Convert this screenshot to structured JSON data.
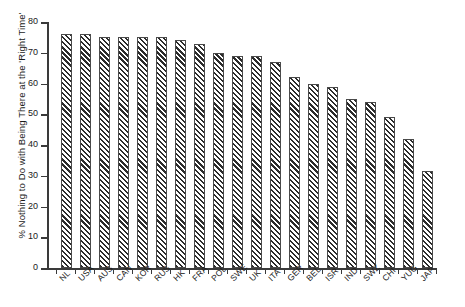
{
  "chart_data": {
    "type": "bar",
    "title": "",
    "xlabel": "",
    "ylabel": "% Nothing to Do with Being There at the 'Right Time'",
    "ylim": [
      0,
      80
    ],
    "yticks": [
      0,
      10,
      20,
      30,
      40,
      50,
      60,
      70,
      80
    ],
    "ytick_labels": [
      "0",
      "10",
      "20",
      "30",
      "40",
      "50",
      "60",
      "70",
      "80"
    ],
    "grid": false,
    "legend": null,
    "bar_fill": "diagonal-hatch",
    "categories": [
      "NL",
      "USA",
      "AUS",
      "CAN",
      "KOR",
      "RUS",
      "HK",
      "FRA",
      "POL",
      "SWE",
      "UK",
      "ITA",
      "GER",
      "BEL",
      "ISR",
      "IND",
      "SWZ",
      "CHI",
      "YUG",
      "JAP"
    ],
    "values": [
      76,
      76,
      75,
      75,
      75,
      75,
      74,
      73,
      70,
      69,
      69,
      67,
      62,
      60,
      59,
      55,
      54,
      49,
      42,
      31.5
    ]
  },
  "colors": {
    "axis": "#3a3a3a",
    "text": "#1a1a1a",
    "bar_outline": "#4a4a4a",
    "bar_hatch": "#2b2b2b",
    "background": "#ffffff"
  }
}
